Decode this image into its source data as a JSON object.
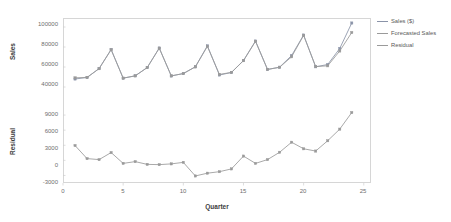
{
  "chart_data": {
    "type": "line",
    "title": "",
    "subtitle": "",
    "xlabel": "Quarter",
    "panels": [
      {
        "name": "sales-panel",
        "ylabel": "Sales",
        "ylim": [
          35000,
          108000
        ],
        "yticks": [
          40000,
          60000,
          80000,
          100000
        ],
        "ytick_labels": [
          "40000",
          "60000",
          "80000",
          "100000"
        ],
        "grid": false,
        "series": [
          {
            "name": "Sales ($)",
            "color": "#8a93a8",
            "values": [
              48000,
              49500,
              58500,
              77500,
              48800,
              51200,
              59500,
              79000,
              51000,
              53500,
              60200,
              81200,
              52000,
              54500,
              66500,
              86000,
              57500,
              59800,
              71500,
              92000,
              60200,
              62500,
              78500,
              104000
            ]
          },
          {
            "name": "Forecasted Sales",
            "color": "#9a9a9a",
            "values": [
              49200,
              49600,
              58300,
              77300,
              48900,
              51100,
              59400,
              78800,
              51200,
              53400,
              60100,
              80600,
              52600,
              54600,
              66300,
              85700,
              57600,
              59700,
              70200,
              91600,
              60400,
              61200,
              76000,
              94500
            ]
          }
        ]
      },
      {
        "name": "residual-panel",
        "ylabel": "Residual",
        "ylim": [
          -4300,
          10800
        ],
        "yticks": [
          -3000,
          0,
          3000,
          6000,
          9000
        ],
        "ytick_labels": [
          "-3000",
          "0",
          "3000",
          "6000",
          "9000"
        ],
        "grid": false,
        "series": [
          {
            "name": "Residual",
            "color": "#9a9a9a",
            "values": [
              2950,
              350,
              150,
              1550,
              -600,
              -250,
              -800,
              -850,
              -700,
              -400,
              -3100,
              -2550,
              -2250,
              -1700,
              850,
              -600,
              150,
              1600,
              3600,
              2300,
              1850,
              3900,
              6200,
              9500
            ]
          }
        ]
      }
    ],
    "x": [
      1,
      2,
      3,
      4,
      5,
      6,
      7,
      8,
      9,
      10,
      11,
      12,
      13,
      14,
      15,
      16,
      17,
      18,
      19,
      20,
      21,
      22,
      23,
      24
    ],
    "xlim": [
      0,
      25.6
    ],
    "xticks": [
      0,
      5,
      10,
      15,
      20,
      25
    ],
    "xtick_labels": [
      "0",
      "5",
      "10",
      "15",
      "20",
      "25"
    ],
    "legend": {
      "position": "right",
      "entries": [
        {
          "label": "Sales ($)",
          "color": "#8a93a8"
        },
        {
          "label": "Forecasted Sales",
          "color": "#9a9a9a"
        },
        {
          "label": "Residual",
          "color": "#9a9a9a"
        }
      ]
    },
    "marker": "square",
    "frame_color": "#d6d6d6"
  }
}
